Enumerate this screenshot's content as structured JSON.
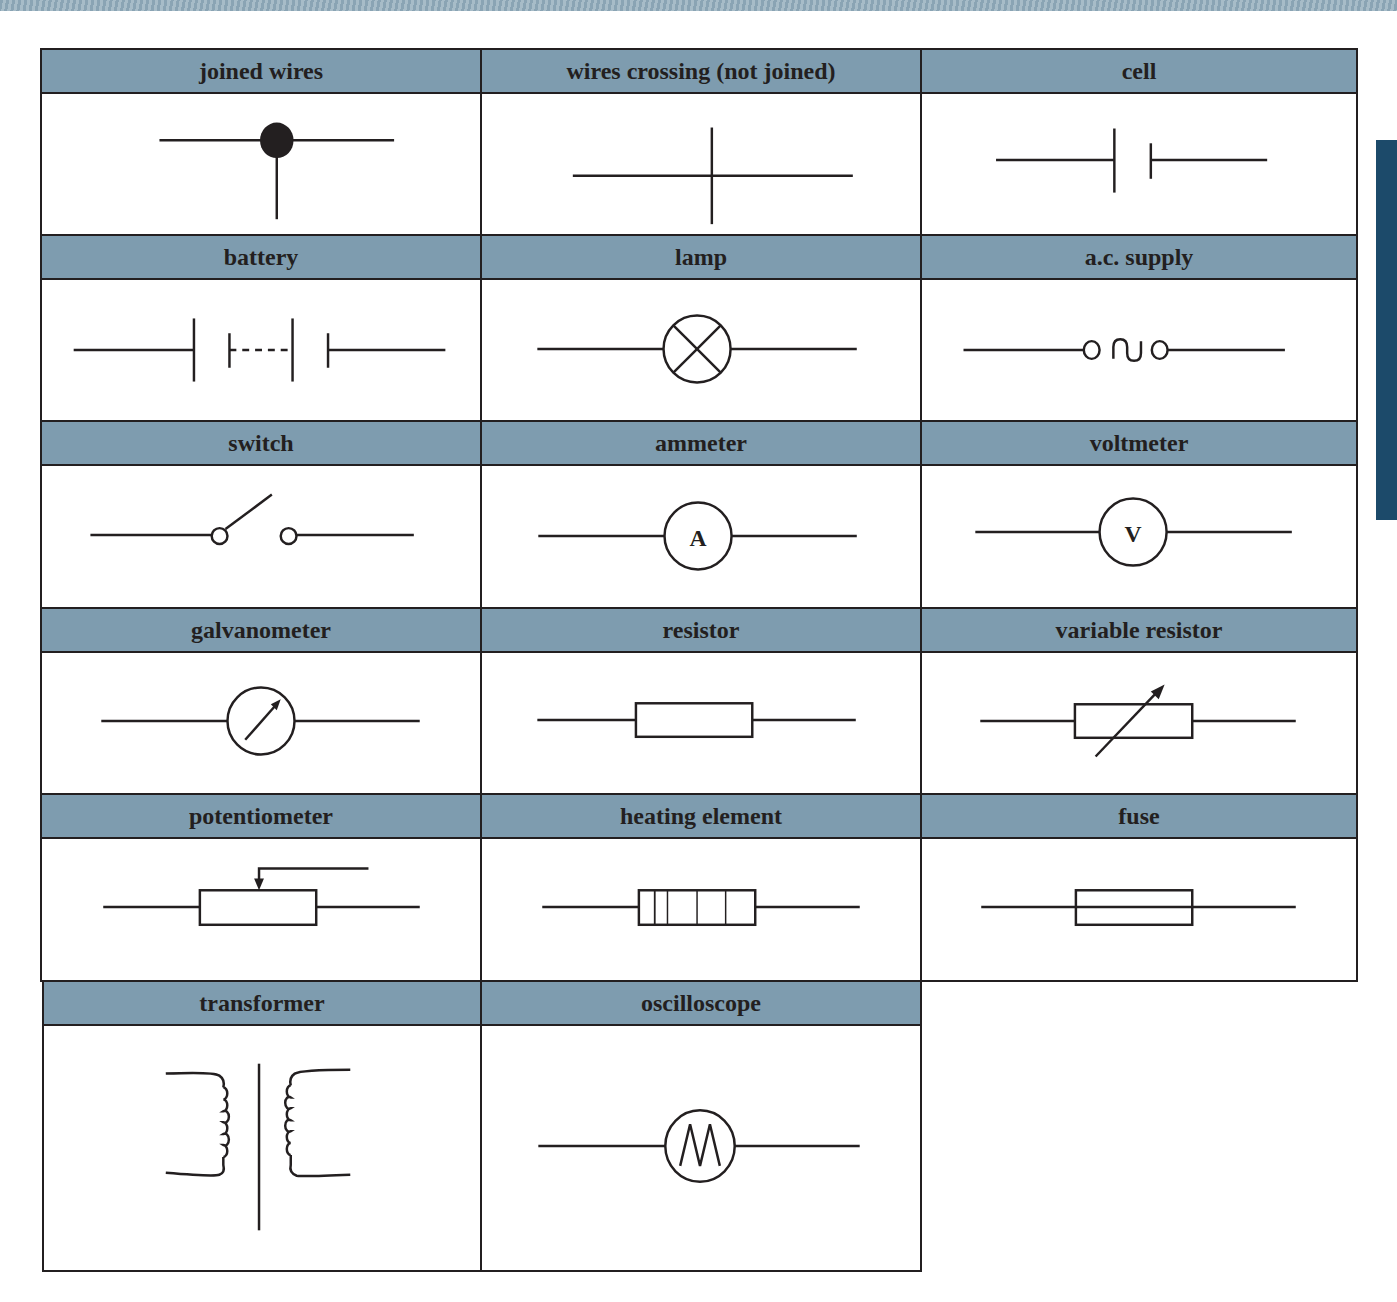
{
  "colors": {
    "header_bg": "#7e9caf",
    "line": "#231f20",
    "side_tab": "#1c4a6a"
  },
  "symbols": [
    {
      "label": "joined wires",
      "icon": "joined-wires-icon"
    },
    {
      "label": "wires crossing (not joined)",
      "icon": "wires-crossing-icon"
    },
    {
      "label": "cell",
      "icon": "cell-icon"
    },
    {
      "label": "battery",
      "icon": "battery-icon"
    },
    {
      "label": "lamp",
      "icon": "lamp-icon"
    },
    {
      "label": "a.c. supply",
      "icon": "ac-supply-icon"
    },
    {
      "label": "switch",
      "icon": "switch-icon"
    },
    {
      "label": "ammeter",
      "icon": "ammeter-icon",
      "glyph": "A"
    },
    {
      "label": "voltmeter",
      "icon": "voltmeter-icon",
      "glyph": "V"
    },
    {
      "label": "galvanometer",
      "icon": "galvanometer-icon"
    },
    {
      "label": "resistor",
      "icon": "resistor-icon"
    },
    {
      "label": "variable resistor",
      "icon": "variable-resistor-icon"
    },
    {
      "label": "potentiometer",
      "icon": "potentiometer-icon"
    },
    {
      "label": "heating element",
      "icon": "heating-element-icon"
    },
    {
      "label": "fuse",
      "icon": "fuse-icon"
    },
    {
      "label": "transformer",
      "icon": "transformer-icon"
    },
    {
      "label": "oscilloscope",
      "icon": "oscilloscope-icon"
    }
  ]
}
